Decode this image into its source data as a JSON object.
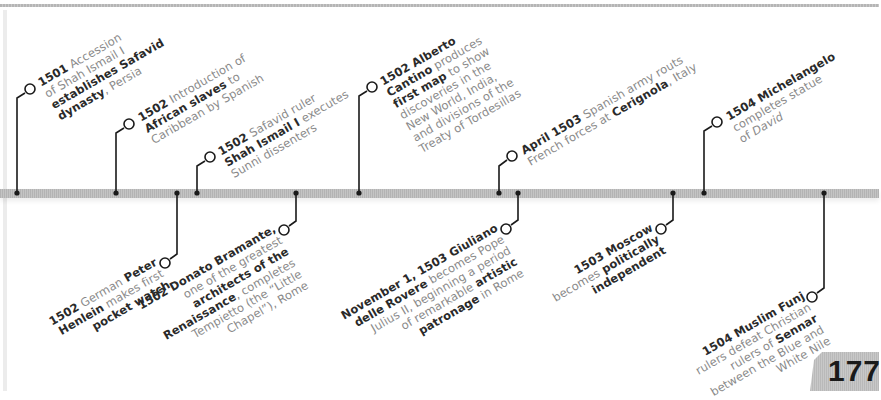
{
  "page": {
    "page_number": "177",
    "colors": {
      "timeline_bar": "#bdbdbd",
      "connector": "#1a1a1a",
      "body_text": "#8a8a8a",
      "bold_text": "#2a2a2a"
    }
  },
  "events_above": [
    {
      "id": "accession-shah-ismail",
      "bar_x": 17,
      "lines": [
        [
          {
            "t": "1501",
            "b": true
          },
          {
            "t": " Accession",
            "b": false
          }
        ],
        [
          {
            "t": "of Shah Ismail I",
            "b": false
          }
        ],
        [
          {
            "t": "establishes Safavid",
            "b": true
          }
        ],
        [
          {
            "t": "dynasty",
            "b": true
          },
          {
            "t": ", Persia",
            "b": false
          }
        ]
      ]
    },
    {
      "id": "african-slaves-caribbean",
      "bar_x": 116,
      "lines": [
        [
          {
            "t": "1502",
            "b": true
          },
          {
            "t": " Introduction of",
            "b": false
          }
        ],
        [
          {
            "t": "African slaves",
            "b": true
          },
          {
            "t": " to",
            "b": false
          }
        ],
        [
          {
            "t": "Caribbean by Spanish",
            "b": false
          }
        ]
      ]
    },
    {
      "id": "shah-ismail-executes",
      "bar_x": 197,
      "lines": [
        [
          {
            "t": "1502",
            "b": true
          },
          {
            "t": " Safavid ruler",
            "b": false
          }
        ],
        [
          {
            "t": "Shah Ismail I",
            "b": true
          },
          {
            "t": " executes",
            "b": false
          }
        ],
        [
          {
            "t": "Sunni dissenters",
            "b": false
          }
        ]
      ]
    },
    {
      "id": "cantino-map",
      "bar_x": 359,
      "lines": [
        [
          {
            "t": "1502 Alberto",
            "b": true
          }
        ],
        [
          {
            "t": "Cantino",
            "b": true
          },
          {
            "t": " produces",
            "b": false
          }
        ],
        [
          {
            "t": "first map",
            "b": true
          },
          {
            "t": " to show",
            "b": false
          }
        ],
        [
          {
            "t": "discoveries in the",
            "b": false
          }
        ],
        [
          {
            "t": "New World, India,",
            "b": false
          }
        ],
        [
          {
            "t": "and divisions of the",
            "b": false
          }
        ],
        [
          {
            "t": "Treaty of Tordesillas",
            "b": false
          }
        ]
      ]
    },
    {
      "id": "battle-cerignola",
      "bar_x": 499,
      "lines": [
        [
          {
            "t": "April 1503",
            "b": true
          },
          {
            "t": " Spanish army routs",
            "b": false
          }
        ],
        [
          {
            "t": "French forces at ",
            "b": false
          },
          {
            "t": "Cerignola",
            "b": true
          },
          {
            "t": ", Italy",
            "b": false
          }
        ]
      ]
    },
    {
      "id": "michelangelo-david",
      "bar_x": 704,
      "lines": [
        [
          {
            "t": "1504 Michelangelo",
            "b": true
          }
        ],
        [
          {
            "t": "completes statue",
            "b": false
          }
        ],
        [
          {
            "t": "of ",
            "b": false
          },
          {
            "t": "David",
            "b": false,
            "i": true
          }
        ]
      ]
    }
  ],
  "events_below": [
    {
      "id": "henlein-pocket-watch",
      "bar_x": 177,
      "lines": [
        [
          {
            "t": "1502",
            "b": true
          },
          {
            "t": " German ",
            "b": false
          },
          {
            "t": "Peter",
            "b": true
          }
        ],
        [
          {
            "t": "Henlein",
            "b": true
          },
          {
            "t": " makes first",
            "b": false
          }
        ],
        [
          {
            "t": "pocket watch",
            "b": true
          }
        ]
      ]
    },
    {
      "id": "bramante-tempietto",
      "bar_x": 296,
      "lines": [
        [
          {
            "t": "1502 Donato Bramante,",
            "b": true
          }
        ],
        [
          {
            "t": "one of the greatest",
            "b": false
          }
        ],
        [
          {
            "t": "architects of the",
            "b": true
          }
        ],
        [
          {
            "t": "Renaissance",
            "b": true
          },
          {
            "t": ", completes",
            "b": false
          }
        ],
        [
          {
            "t": "Tempietto (the “Little",
            "b": false
          }
        ],
        [
          {
            "t": "Chapel”), Rome",
            "b": false
          }
        ]
      ]
    },
    {
      "id": "julius-ii-pope",
      "bar_x": 518,
      "lines": [
        [
          {
            "t": "November 1, 1503 Giuliano",
            "b": true
          }
        ],
        [
          {
            "t": "delle Rovere",
            "b": true
          },
          {
            "t": " becomes Pope",
            "b": false
          }
        ],
        [
          {
            "t": "Julius II, beginning a period",
            "b": false
          }
        ],
        [
          {
            "t": "of remarkable ",
            "b": false
          },
          {
            "t": "artistic",
            "b": true
          }
        ],
        [
          {
            "t": "patronage",
            "b": true
          },
          {
            "t": " in Rome",
            "b": false
          }
        ]
      ]
    },
    {
      "id": "moscow-independent",
      "bar_x": 673,
      "lines": [
        [
          {
            "t": "1503 Moscow",
            "b": true
          }
        ],
        [
          {
            "t": "becomes ",
            "b": false
          },
          {
            "t": "politically",
            "b": true
          }
        ],
        [
          {
            "t": "independent",
            "b": true
          }
        ]
      ]
    },
    {
      "id": "muslim-funj-sennar",
      "bar_x": 824,
      "lines": [
        [
          {
            "t": "1504 Muslim Funj",
            "b": true
          }
        ],
        [
          {
            "t": "rulers defeat Christian",
            "b": false
          }
        ],
        [
          {
            "t": "rulers of ",
            "b": false
          },
          {
            "t": "Sennar",
            "b": true
          }
        ],
        [
          {
            "t": "between the Blue and",
            "b": false
          }
        ],
        [
          {
            "t": "White Nile",
            "b": false
          }
        ]
      ]
    }
  ]
}
